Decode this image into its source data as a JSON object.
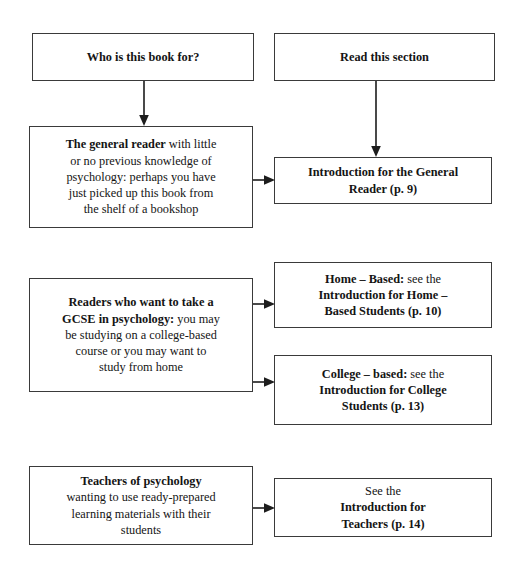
{
  "diagram": {
    "line_color": "#3a3a3a",
    "text_color": "#141414",
    "background": "#ffffff",
    "headers": {
      "left": "Who is this book for?",
      "right": "Read this section"
    },
    "rows": [
      {
        "id": "general-reader",
        "audience": {
          "lines": [
            {
              "bold": "The general reader",
              "normal": " with little"
            },
            {
              "bold": "",
              "normal": "or no previous knowledge of"
            },
            {
              "bold": "",
              "normal": "psychology: perhaps you have"
            },
            {
              "bold": "",
              "normal": "just picked up this book from"
            },
            {
              "bold": "",
              "normal": "the shelf of a bookshop"
            }
          ]
        },
        "targets": [
          {
            "lines": [
              {
                "bold": "Introduction for the General",
                "normal": ""
              },
              {
                "bold": "Reader (p. 9)",
                "normal": ""
              }
            ]
          }
        ]
      },
      {
        "id": "gcse-readers",
        "audience": {
          "lines": [
            {
              "bold": "Readers who want to take a",
              "normal": ""
            },
            {
              "bold": "GCSE in psychology:",
              "normal": " you may"
            },
            {
              "bold": "",
              "normal": "be studying on a college-based"
            },
            {
              "bold": "",
              "normal": "course or you may want to"
            },
            {
              "bold": "",
              "normal": "study from home"
            }
          ]
        },
        "targets": [
          {
            "lines": [
              {
                "bold": "Home – Based:",
                "normal": " see the"
              },
              {
                "bold": "Introduction for Home –",
                "normal": ""
              },
              {
                "bold": "Based Students (p. 10)",
                "normal": ""
              }
            ]
          },
          {
            "lines": [
              {
                "bold": "College – based:",
                "normal": " see the"
              },
              {
                "bold": "Introduction for College",
                "normal": ""
              },
              {
                "bold": "Students (p. 13)",
                "normal": ""
              }
            ]
          }
        ]
      },
      {
        "id": "teachers",
        "audience": {
          "lines": [
            {
              "bold": "Teachers of psychology",
              "normal": ""
            },
            {
              "bold": "",
              "normal": "wanting to use ready-prepared"
            },
            {
              "bold": "",
              "normal": "learning materials with their"
            },
            {
              "bold": "",
              "normal": "students"
            }
          ]
        },
        "targets": [
          {
            "lines": [
              {
                "bold": "",
                "normal": "See the "
              },
              {
                "bold": "Introduction for",
                "normal": ""
              },
              {
                "bold": "Teachers (p. 14)",
                "normal": ""
              }
            ]
          }
        ]
      }
    ],
    "connectors": [
      {
        "name": "header-left-to-general-reader",
        "kind": "vertical"
      },
      {
        "name": "header-right-to-general-reader-target",
        "kind": "vertical"
      },
      {
        "name": "general-reader-to-target",
        "kind": "horizontal"
      },
      {
        "name": "gcse-to-home-based",
        "kind": "horizontal"
      },
      {
        "name": "gcse-to-college-based",
        "kind": "horizontal"
      },
      {
        "name": "teachers-to-target",
        "kind": "horizontal"
      }
    ]
  }
}
